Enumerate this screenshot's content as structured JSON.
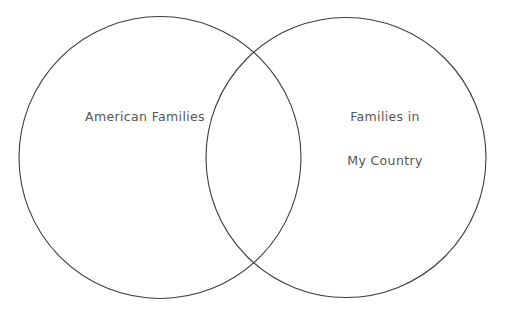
{
  "diagram": {
    "type": "venn",
    "title": "",
    "background_color": "#ffffff",
    "stroke_color": "#3c3c3c",
    "text_color": "#565656",
    "sets": [
      {
        "id": "left",
        "label": "American Families",
        "label_lines": [
          "American Families"
        ],
        "center_x": 160,
        "center_y": 157,
        "radius": 141
      },
      {
        "id": "right",
        "label": "Families in My Country",
        "label_lines": [
          "Families in",
          "My Country"
        ],
        "center_x": 346,
        "center_y": 157,
        "radius": 140
      }
    ],
    "overlap_label": ""
  }
}
